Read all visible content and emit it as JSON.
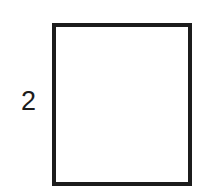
{
  "figure": {
    "type": "geometry-diagram",
    "background_color": "#ffffff",
    "stroke_color": "#1c1c1c",
    "stroke_width": 4,
    "canvas": {
      "width": 214,
      "height": 195
    },
    "shape": {
      "name": "square",
      "x": 52,
      "y": 23,
      "width": 140,
      "height": 163,
      "fill": "none"
    },
    "labels": [
      {
        "id": "left-side",
        "text": "2",
        "meaning": "side-length",
        "position": "left-of-square",
        "x": 21,
        "y": 88,
        "font_size": 27,
        "color": "#1c1c1c"
      }
    ]
  }
}
